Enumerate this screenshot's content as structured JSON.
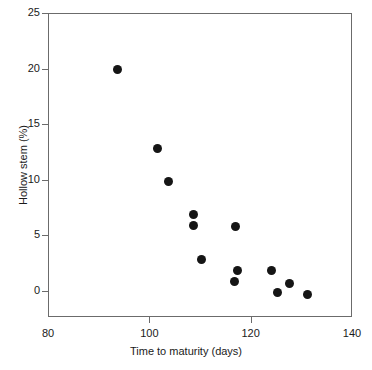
{
  "chart_data": {
    "type": "scatter",
    "title": "",
    "xlabel": "Time to maturity (days)",
    "ylabel": "Hollow stem (%)",
    "xlim": [
      80,
      140
    ],
    "ylim": [
      0,
      25
    ],
    "y_axis_note": "axis line extends below 0 to the frame bottom",
    "grid": false,
    "legend": "none",
    "xticks": [
      80,
      100,
      120,
      140
    ],
    "xtick_labels": [
      "80",
      "100",
      "120",
      "140"
    ],
    "yticks": [
      0,
      5,
      10,
      15,
      20,
      25
    ],
    "ytick_labels": [
      "0",
      "5",
      "10",
      "15",
      "20",
      "25"
    ],
    "marker": {
      "shape": "circle",
      "filled": true,
      "color": "#151515",
      "size_px": 9
    },
    "points": [
      {
        "x": 93.5,
        "y": 20.0
      },
      {
        "x": 101.5,
        "y": 12.9
      },
      {
        "x": 103.5,
        "y": 9.9
      },
      {
        "x": 108.6,
        "y": 7.0
      },
      {
        "x": 108.6,
        "y": 6.0
      },
      {
        "x": 110.0,
        "y": 2.9
      },
      {
        "x": 116.8,
        "y": 5.9
      },
      {
        "x": 117.3,
        "y": 1.9
      },
      {
        "x": 116.7,
        "y": 0.9
      },
      {
        "x": 124.0,
        "y": 1.9
      },
      {
        "x": 125.0,
        "y": -0.05
      },
      {
        "x": 127.5,
        "y": 0.8
      },
      {
        "x": 131.0,
        "y": -0.2
      }
    ],
    "n_points": 13,
    "colors": {
      "background": "#ffffff",
      "axis": "#6b6b6b",
      "text": "#1a1a1a",
      "marker": "#151515"
    }
  }
}
